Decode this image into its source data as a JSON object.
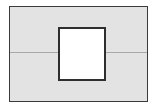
{
  "figure": {
    "title": "",
    "background_color": "#ffffff"
  },
  "outer_panel": {
    "name": "outer-rectangle",
    "fill_color": "#e3e3e3",
    "border_color": "#3b3b3b",
    "border_width_px": 1.5,
    "x": 9,
    "y": 6,
    "width": 139,
    "height": 96,
    "label": ""
  },
  "divider": {
    "name": "horizontal-divider-line",
    "color": "#a8a8a8",
    "thickness_px": 1,
    "y": 52,
    "label": ""
  },
  "inner_square": {
    "name": "inner-square",
    "fill_color": "#ffffff",
    "border_color": "#2e2e2e",
    "border_width_px": 2,
    "x": 58,
    "y": 27,
    "width": 48,
    "height": 54,
    "label": ""
  }
}
